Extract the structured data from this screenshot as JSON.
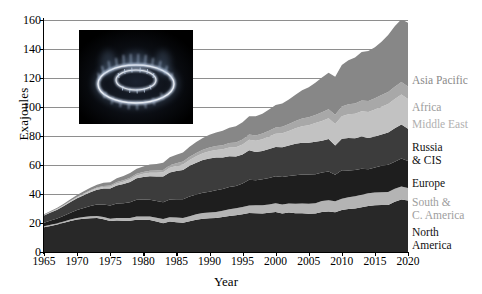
{
  "chart_data": {
    "type": "area",
    "title": "",
    "xlabel": "Year",
    "ylabel": "Exajoules",
    "xlim": [
      1965,
      2020
    ],
    "ylim": [
      0,
      160
    ],
    "ytick_labels": [
      "0",
      "20",
      "40",
      "60",
      "80",
      "100",
      "120",
      "140",
      "160"
    ],
    "ytick_values": [
      0,
      20,
      40,
      60,
      80,
      100,
      120,
      140,
      160
    ],
    "xtick_labels": [
      "1965",
      "1970",
      "1975",
      "1980",
      "1985",
      "1990",
      "1995",
      "2000",
      "2005",
      "2010",
      "2015",
      "2020"
    ],
    "xtick_values": [
      1965,
      1970,
      1975,
      1980,
      1985,
      1990,
      1995,
      2000,
      2005,
      2010,
      2015,
      2020
    ],
    "grid": true,
    "legend_position": "right-outside",
    "stacked": true,
    "x": [
      1965,
      1966,
      1967,
      1968,
      1969,
      1970,
      1971,
      1972,
      1973,
      1974,
      1975,
      1976,
      1977,
      1978,
      1979,
      1980,
      1981,
      1982,
      1983,
      1984,
      1985,
      1986,
      1987,
      1988,
      1989,
      1990,
      1991,
      1992,
      1993,
      1994,
      1995,
      1996,
      1997,
      1998,
      1999,
      2000,
      2001,
      2002,
      2003,
      2004,
      2005,
      2006,
      2007,
      2008,
      2009,
      2010,
      2011,
      2012,
      2013,
      2014,
      2015,
      2016,
      2017,
      2018,
      2019,
      2020
    ],
    "series": [
      {
        "name": "North America",
        "color": "#282828",
        "values": [
          17.0,
          18.0,
          19.0,
          20.2,
          21.4,
          22.4,
          22.9,
          23.3,
          23.4,
          22.6,
          21.4,
          21.8,
          21.6,
          21.5,
          22.3,
          22.2,
          22.0,
          21.0,
          19.9,
          21.0,
          20.6,
          20.2,
          21.2,
          22.3,
          23.0,
          23.2,
          23.4,
          24.1,
          24.8,
          25.3,
          26.1,
          26.9,
          26.8,
          26.6,
          27.0,
          27.6,
          26.6,
          27.2,
          26.7,
          26.7,
          26.3,
          26.5,
          27.6,
          28.0,
          27.5,
          28.9,
          29.6,
          30.0,
          30.9,
          31.8,
          32.2,
          32.4,
          32.5,
          34.6,
          36.2,
          35.5
        ]
      },
      {
        "name": "South & C. America",
        "color": "#b4b4b4",
        "values": [
          0.7,
          0.8,
          0.8,
          0.9,
          1.0,
          1.1,
          1.2,
          1.3,
          1.4,
          1.5,
          1.6,
          1.7,
          1.9,
          2.0,
          2.2,
          2.3,
          2.5,
          2.6,
          2.8,
          3.0,
          3.2,
          3.3,
          3.5,
          3.7,
          3.9,
          4.0,
          4.2,
          4.4,
          4.6,
          4.8,
          5.0,
          5.2,
          5.4,
          5.6,
          5.8,
          6.0,
          6.1,
          6.2,
          6.5,
          6.8,
          7.0,
          7.2,
          7.5,
          7.7,
          7.5,
          7.9,
          8.2,
          8.4,
          8.6,
          8.7,
          8.8,
          8.8,
          8.9,
          9.0,
          9.0,
          8.6
        ]
      },
      {
        "name": "Europe",
        "color": "#1e1e1e",
        "values": [
          2.5,
          2.9,
          3.3,
          3.9,
          4.6,
          5.4,
          6.3,
          7.2,
          8.0,
          8.7,
          9.1,
          9.9,
          10.2,
          10.8,
          11.5,
          11.7,
          11.6,
          11.5,
          11.6,
          12.2,
          12.5,
          12.8,
          13.5,
          13.6,
          13.9,
          14.3,
          15.0,
          15.0,
          15.4,
          15.4,
          16.2,
          17.7,
          17.3,
          17.9,
          18.2,
          18.7,
          19.0,
          19.0,
          19.8,
          20.0,
          20.1,
          20.0,
          19.7,
          19.8,
          18.2,
          19.6,
          18.4,
          18.1,
          18.0,
          16.5,
          17.3,
          18.2,
          18.7,
          18.7,
          19.3,
          18.6
        ]
      },
      {
        "name": "Russia & CIS",
        "color": "#3c3c3c",
        "values": [
          4.9,
          5.5,
          6.1,
          6.7,
          7.4,
          8.1,
          8.8,
          9.4,
          10.1,
          11.0,
          11.7,
          12.5,
          13.2,
          14.0,
          14.8,
          15.5,
          16.2,
          17.0,
          17.8,
          18.7,
          19.5,
          20.3,
          21.2,
          22.0,
          22.6,
          22.9,
          22.5,
          21.6,
          21.2,
          20.3,
          20.0,
          20.4,
          19.5,
          19.6,
          20.0,
          20.2,
          20.6,
          21.0,
          21.6,
          21.9,
          22.0,
          22.4,
          22.0,
          22.5,
          20.2,
          21.7,
          22.5,
          21.9,
          22.2,
          21.6,
          21.3,
          21.7,
          22.4,
          23.0,
          23.5,
          22.3
        ]
      },
      {
        "name": "Middle East",
        "color": "#c2c2c2",
        "values": [
          0.3,
          0.4,
          0.4,
          0.5,
          0.6,
          0.7,
          0.8,
          0.9,
          1.0,
          1.1,
          1.2,
          1.4,
          1.6,
          1.8,
          2.0,
          2.2,
          2.4,
          2.6,
          2.9,
          3.2,
          3.5,
          3.8,
          4.1,
          4.4,
          4.7,
          5.0,
          5.3,
          5.7,
          6.1,
          6.5,
          6.9,
          7.3,
          7.7,
          8.1,
          8.6,
          9.1,
          9.6,
          10.1,
          10.8,
          11.4,
          12.1,
          12.8,
          13.6,
          14.3,
          14.9,
          15.6,
          16.3,
          16.9,
          17.4,
          18.0,
          18.6,
          19.1,
          19.6,
          20.2,
          20.7,
          20.6
        ]
      },
      {
        "name": "Africa",
        "color": "#a8a8a8",
        "values": [
          0.1,
          0.1,
          0.2,
          0.2,
          0.3,
          0.3,
          0.4,
          0.5,
          0.6,
          0.7,
          0.8,
          0.9,
          1.0,
          1.1,
          1.2,
          1.3,
          1.4,
          1.5,
          1.6,
          1.8,
          1.9,
          2.0,
          2.2,
          2.3,
          2.4,
          2.6,
          2.7,
          2.9,
          3.0,
          3.2,
          3.4,
          3.5,
          3.7,
          3.9,
          4.1,
          4.3,
          4.5,
          4.7,
          4.9,
          5.2,
          5.4,
          5.6,
          5.9,
          6.1,
          6.3,
          6.6,
          6.9,
          7.1,
          7.3,
          7.5,
          7.8,
          8.0,
          8.2,
          8.4,
          8.6,
          8.5
        ]
      },
      {
        "name": "Asia Pacific",
        "color": "#878787",
        "values": [
          0.5,
          0.6,
          0.7,
          0.9,
          1.1,
          1.3,
          1.5,
          1.7,
          1.9,
          2.1,
          2.3,
          2.6,
          2.9,
          3.2,
          3.5,
          3.8,
          4.2,
          4.5,
          4.9,
          5.4,
          5.9,
          6.3,
          6.9,
          7.5,
          8.2,
          8.8,
          9.4,
          10.0,
          10.6,
          11.2,
          11.9,
          12.6,
          13.3,
          13.7,
          14.5,
          15.4,
          16.1,
          17.0,
          18.2,
          19.5,
          20.8,
          22.3,
          24.0,
          25.2,
          26.3,
          28.6,
          30.4,
          31.8,
          33.5,
          34.6,
          35.2,
          36.8,
          39.3,
          41.8,
          43.2,
          44.0
        ]
      }
    ],
    "totals_note": ""
  },
  "legend": {
    "items": [
      {
        "label": "Asia Pacific",
        "color": "#8a8a8a",
        "top": 74
      },
      {
        "label": "Africa",
        "color": "#9b9b9b",
        "top": 101
      },
      {
        "label": "Middle East",
        "color": "#b0b0b0",
        "top": 118
      },
      {
        "label": "Russia\n& CIS",
        "color": "#111111",
        "top": 141
      },
      {
        "label": "Europe",
        "color": "#111111",
        "top": 177
      },
      {
        "label": "South &\nC. America",
        "color": "#9e9e9e",
        "top": 196
      },
      {
        "label": "North\nAmerica",
        "color": "#111111",
        "top": 226
      }
    ]
  },
  "inset": {
    "name": "gas-burner-flame-photo",
    "background": "#000000",
    "flame_color": "#cfd8e8"
  }
}
